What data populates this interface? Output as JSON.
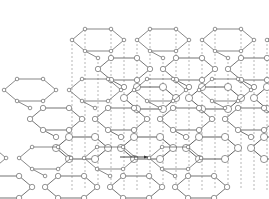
{
  "figure": {
    "name": "layered-hexagonal-crystal-lattice",
    "title": "",
    "caption": "",
    "width": 269,
    "height": 199,
    "background_color": "#ffffff"
  },
  "style": {
    "bond_color": "#555555",
    "bond_width": 0.7,
    "atom_stroke_color": "#666666",
    "atom_fill_color": "#ffffff",
    "atom_stroke_width": 0.7,
    "stacking_line_color": "#888888",
    "stacking_line_width": 0.6,
    "stacking_dash": "2,2",
    "arrow_color": "#333333"
  },
  "lattice": {
    "type": "layered-honeycomb",
    "layer_count": 3,
    "rows_per_layer": 3,
    "cols_per_layer": 4,
    "hex_width": 52,
    "hex_half_height": 11,
    "hex_shoulder": 13,
    "row_step_x": 26,
    "row_step_y": 29,
    "layer_offset_x": 58,
    "layer_offset_y": 68,
    "atom_radius_near": 3.6,
    "atom_radius_far": 1.8,
    "layers": [
      {
        "name": "top-layer",
        "origin_x": 18,
        "origin_y": 18
      },
      {
        "name": "middle-layer",
        "origin_x": 0,
        "origin_y": 0
      },
      {
        "name": "bottom-layer",
        "origin_x": 0,
        "origin_y": 0
      }
    ]
  },
  "stacking_lines": {
    "name": "interlayer-stacking-guides",
    "count": 16,
    "y_top": 30,
    "y_bottom": 190
  },
  "annotation": {
    "arrow": {
      "name": "direction-arrow",
      "x1": 120,
      "y1": 157,
      "x2": 148,
      "y2": 157,
      "label": ""
    }
  }
}
